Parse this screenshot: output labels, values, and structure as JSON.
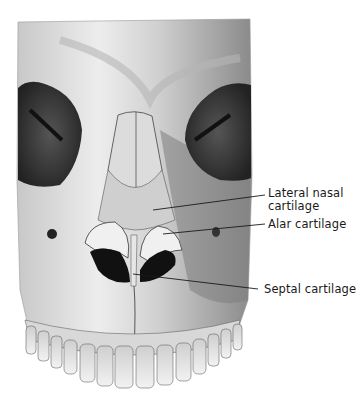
{
  "figure": {
    "labels": [
      {
        "id": "lateral",
        "lines": [
          "Lateral nasal",
          "cartilage"
        ]
      },
      {
        "id": "alar",
        "lines": [
          "Alar cartilage"
        ]
      },
      {
        "id": "septal",
        "lines": [
          "Septal cartilage"
        ]
      }
    ],
    "leader_lines": [
      {
        "label": "lateral",
        "from": [
          153,
          210
        ],
        "to": [
          265,
          195
        ]
      },
      {
        "label": "alar",
        "from": [
          163,
          234
        ],
        "to": [
          265,
          224
        ]
      },
      {
        "label": "septal",
        "from": [
          133,
          274
        ],
        "to": [
          258,
          289
        ]
      }
    ],
    "colors": {
      "background": "#ffffff",
      "bone": "#e4e4e4",
      "shadow": "#3a3a3a",
      "ink": "#1a1a1a"
    }
  }
}
